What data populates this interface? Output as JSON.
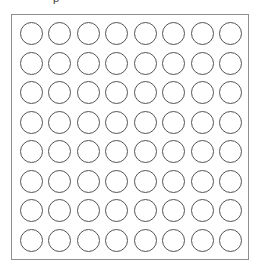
{
  "diagram": {
    "kind": "circle-pad-array",
    "title": "",
    "top_artifact_text": "p",
    "outline": {
      "shape": "rectangle",
      "x": 11,
      "y": 14,
      "width": 238,
      "height": 246,
      "stroke_color": "#8e8e8e",
      "stroke_width": 1,
      "fill_color": "#ffffff"
    },
    "grid": {
      "rows": 8,
      "columns": 8,
      "total_pads": 64,
      "pad_shape": "circle",
      "pad_diameter": 23,
      "pad_stroke_color": "#555555",
      "pad_fill": "none",
      "column_pitch": 29,
      "row_pitch": 30
    },
    "background_color": "#ffffff",
    "pads": [
      {
        "row": 1,
        "col": 1,
        "label": ""
      },
      {
        "row": 1,
        "col": 2,
        "label": ""
      },
      {
        "row": 1,
        "col": 3,
        "label": ""
      },
      {
        "row": 1,
        "col": 4,
        "label": ""
      },
      {
        "row": 1,
        "col": 5,
        "label": ""
      },
      {
        "row": 1,
        "col": 6,
        "label": ""
      },
      {
        "row": 1,
        "col": 7,
        "label": ""
      },
      {
        "row": 1,
        "col": 8,
        "label": ""
      },
      {
        "row": 2,
        "col": 1,
        "label": ""
      },
      {
        "row": 2,
        "col": 2,
        "label": ""
      },
      {
        "row": 2,
        "col": 3,
        "label": ""
      },
      {
        "row": 2,
        "col": 4,
        "label": ""
      },
      {
        "row": 2,
        "col": 5,
        "label": ""
      },
      {
        "row": 2,
        "col": 6,
        "label": ""
      },
      {
        "row": 2,
        "col": 7,
        "label": ""
      },
      {
        "row": 2,
        "col": 8,
        "label": ""
      },
      {
        "row": 3,
        "col": 1,
        "label": ""
      },
      {
        "row": 3,
        "col": 2,
        "label": ""
      },
      {
        "row": 3,
        "col": 3,
        "label": ""
      },
      {
        "row": 3,
        "col": 4,
        "label": ""
      },
      {
        "row": 3,
        "col": 5,
        "label": ""
      },
      {
        "row": 3,
        "col": 6,
        "label": ""
      },
      {
        "row": 3,
        "col": 7,
        "label": ""
      },
      {
        "row": 3,
        "col": 8,
        "label": ""
      },
      {
        "row": 4,
        "col": 1,
        "label": ""
      },
      {
        "row": 4,
        "col": 2,
        "label": ""
      },
      {
        "row": 4,
        "col": 3,
        "label": ""
      },
      {
        "row": 4,
        "col": 4,
        "label": ""
      },
      {
        "row": 4,
        "col": 5,
        "label": ""
      },
      {
        "row": 4,
        "col": 6,
        "label": ""
      },
      {
        "row": 4,
        "col": 7,
        "label": ""
      },
      {
        "row": 4,
        "col": 8,
        "label": ""
      },
      {
        "row": 5,
        "col": 1,
        "label": ""
      },
      {
        "row": 5,
        "col": 2,
        "label": ""
      },
      {
        "row": 5,
        "col": 3,
        "label": ""
      },
      {
        "row": 5,
        "col": 4,
        "label": ""
      },
      {
        "row": 5,
        "col": 5,
        "label": ""
      },
      {
        "row": 5,
        "col": 6,
        "label": ""
      },
      {
        "row": 5,
        "col": 7,
        "label": ""
      },
      {
        "row": 5,
        "col": 8,
        "label": ""
      },
      {
        "row": 6,
        "col": 1,
        "label": ""
      },
      {
        "row": 6,
        "col": 2,
        "label": ""
      },
      {
        "row": 6,
        "col": 3,
        "label": ""
      },
      {
        "row": 6,
        "col": 4,
        "label": ""
      },
      {
        "row": 6,
        "col": 5,
        "label": ""
      },
      {
        "row": 6,
        "col": 6,
        "label": ""
      },
      {
        "row": 6,
        "col": 7,
        "label": ""
      },
      {
        "row": 6,
        "col": 8,
        "label": ""
      },
      {
        "row": 7,
        "col": 1,
        "label": ""
      },
      {
        "row": 7,
        "col": 2,
        "label": ""
      },
      {
        "row": 7,
        "col": 3,
        "label": ""
      },
      {
        "row": 7,
        "col": 4,
        "label": ""
      },
      {
        "row": 7,
        "col": 5,
        "label": ""
      },
      {
        "row": 7,
        "col": 6,
        "label": ""
      },
      {
        "row": 7,
        "col": 7,
        "label": ""
      },
      {
        "row": 7,
        "col": 8,
        "label": ""
      },
      {
        "row": 8,
        "col": 1,
        "label": ""
      },
      {
        "row": 8,
        "col": 2,
        "label": ""
      },
      {
        "row": 8,
        "col": 3,
        "label": ""
      },
      {
        "row": 8,
        "col": 4,
        "label": ""
      },
      {
        "row": 8,
        "col": 5,
        "label": ""
      },
      {
        "row": 8,
        "col": 6,
        "label": ""
      },
      {
        "row": 8,
        "col": 7,
        "label": ""
      },
      {
        "row": 8,
        "col": 8,
        "label": ""
      }
    ]
  }
}
